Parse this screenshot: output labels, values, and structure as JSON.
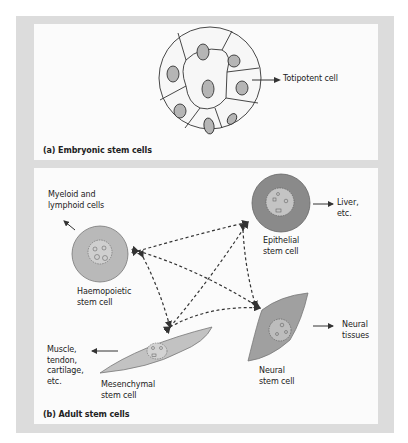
{
  "panel_a": {
    "caption": "(a)  Embryonic stem cells",
    "cell_label": "Totipotent cell",
    "icon": "blastocyst-icon"
  },
  "panel_b": {
    "caption": "(b)  Adult stem cells",
    "cells": [
      {
        "id": "haemopoietic",
        "name": "Haemopoietic\nstem cell",
        "product": "Myeloid and\nlymphoid cells",
        "color": "#b9b9b9"
      },
      {
        "id": "epithelial",
        "name": "Epithelial\nstem cell",
        "product": "Liver,\netc.",
        "color": "#8a8a8a"
      },
      {
        "id": "mesenchymal",
        "name": "Mesenchymal\nstem cell",
        "product": "Muscle,\ntendon,\ncartilage,\netc.",
        "color": "#c2c2c2"
      },
      {
        "id": "neural",
        "name": "Neural\nstem cell",
        "product": "Neural\ntissues",
        "color": "#a0a0a0"
      }
    ],
    "links": "dashed bidirectional arrows between all four adult stem cell types"
  },
  "colors": {
    "frame": "#dcdcdc",
    "panel": "#fbfbfb",
    "nucleus_fill": "#b5b5b5",
    "line": "#333333"
  }
}
